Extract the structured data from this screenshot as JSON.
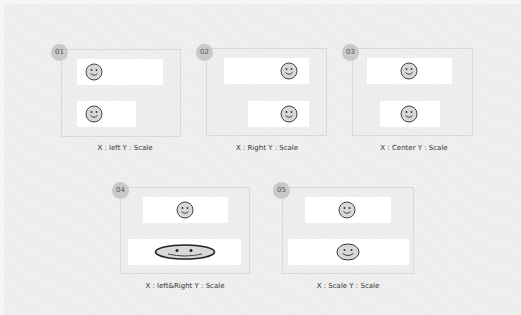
{
  "panels": [
    {
      "badge": "01",
      "caption": "X : left   Y : Scale",
      "x_mode": "left",
      "y_mode": "Scale"
    },
    {
      "badge": "02",
      "caption": "X : Right   Y : Scale",
      "x_mode": "Right",
      "y_mode": "Scale"
    },
    {
      "badge": "03",
      "caption": "X : Center   Y : Scale",
      "x_mode": "Center",
      "y_mode": "Scale"
    },
    {
      "badge": "04",
      "caption": "X : left&Right   Y : Scale",
      "x_mode": "left&Right",
      "y_mode": "Scale"
    },
    {
      "badge": "05",
      "caption": "X : Scale   Y : Scale",
      "x_mode": "Scale",
      "y_mode": "Scale"
    }
  ],
  "icons": {
    "smiley": "smiley-face-icon"
  },
  "colors": {
    "background": "#ececec",
    "bar": "#ffffff",
    "badge": "#c9c9c9",
    "smiley_fill": "#d8d8d8",
    "smiley_stroke": "#333333"
  }
}
